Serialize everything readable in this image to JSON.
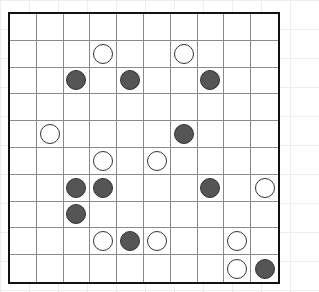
{
  "board": {
    "rows": 10,
    "cols": 10,
    "colors": {
      "white": "#ffffff",
      "black": "#555555",
      "grid": "#8a8a8a",
      "border": "#111111"
    },
    "stones": [
      {
        "row": 1,
        "col": 3,
        "color": "white"
      },
      {
        "row": 1,
        "col": 6,
        "color": "white"
      },
      {
        "row": 2,
        "col": 2,
        "color": "black"
      },
      {
        "row": 2,
        "col": 4,
        "color": "black"
      },
      {
        "row": 2,
        "col": 7,
        "color": "black"
      },
      {
        "row": 4,
        "col": 1,
        "color": "white"
      },
      {
        "row": 4,
        "col": 6,
        "color": "black"
      },
      {
        "row": 5,
        "col": 3,
        "color": "white"
      },
      {
        "row": 5,
        "col": 5,
        "color": "white"
      },
      {
        "row": 6,
        "col": 2,
        "color": "black"
      },
      {
        "row": 6,
        "col": 3,
        "color": "black"
      },
      {
        "row": 6,
        "col": 7,
        "color": "black"
      },
      {
        "row": 6,
        "col": 9,
        "color": "white"
      },
      {
        "row": 7,
        "col": 2,
        "color": "black"
      },
      {
        "row": 8,
        "col": 3,
        "color": "white"
      },
      {
        "row": 8,
        "col": 4,
        "color": "black"
      },
      {
        "row": 8,
        "col": 5,
        "color": "white"
      },
      {
        "row": 8,
        "col": 8,
        "color": "white"
      },
      {
        "row": 9,
        "col": 8,
        "color": "white"
      },
      {
        "row": 9,
        "col": 9,
        "color": "black"
      }
    ]
  }
}
